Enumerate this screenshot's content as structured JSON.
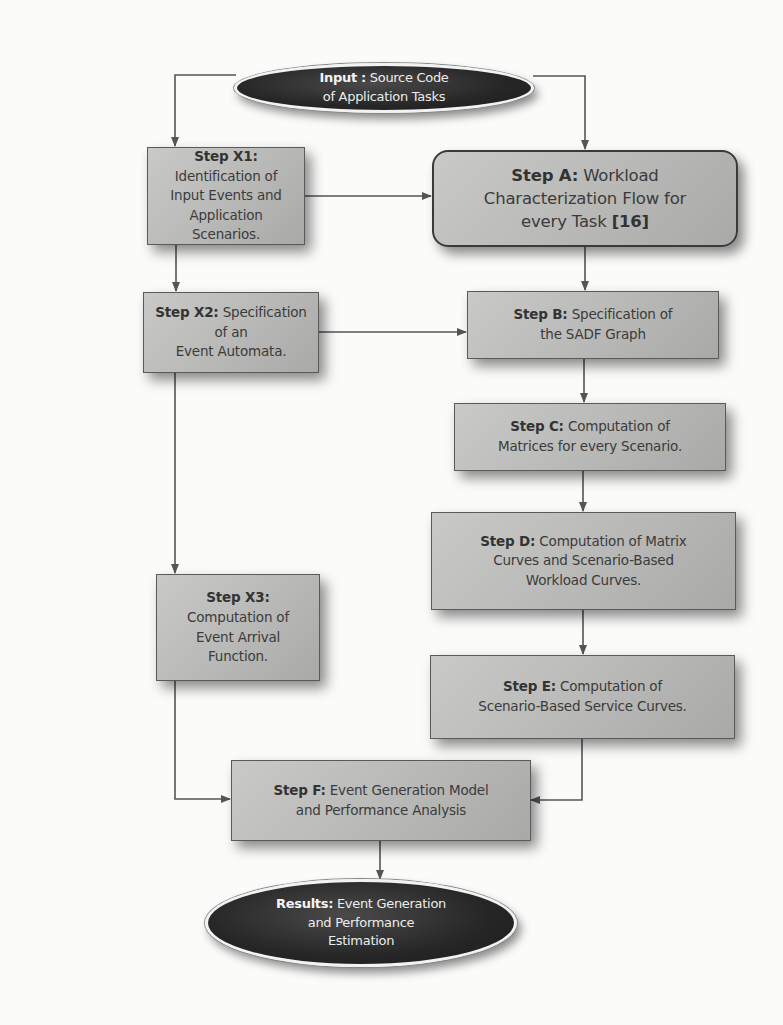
{
  "diagram": {
    "type": "flowchart",
    "colors": {
      "box_fill": "#b8b8b6",
      "box_border": "#5a5a5a",
      "ellipse_fill": "#262626",
      "ellipse_text": "#ececec",
      "arrow": "#555555",
      "background": "#fbfbfa"
    },
    "nodes": {
      "input": {
        "bold": "Input :",
        "line1": " Source Code",
        "line2": "of Application Tasks"
      },
      "x1": {
        "bold": "Step X1:",
        "line1": " Identification of",
        "line2": "Input Events and",
        "line3": "Application Scenarios."
      },
      "a": {
        "bold": "Step A:",
        "line1": "  Workload",
        "line2": "Characterization Flow for",
        "line3": "every Task ",
        "ref": "[16]"
      },
      "x2": {
        "bold": "Step X2:",
        "line1": " Specification of an",
        "line2": "Event Automata."
      },
      "b": {
        "bold": "Step B:",
        "line1": " Specification of",
        "line2": "the SADF Graph"
      },
      "c": {
        "bold": "Step C:",
        "line1": " Computation of",
        "line2": "Matrices for every Scenario."
      },
      "d": {
        "bold": "Step D:",
        "line1": " Computation of Matrix",
        "line2": "Curves  and Scenario-Based",
        "line3": "Workload Curves."
      },
      "x3": {
        "bold": "Step X3:",
        "line2": "Computation of",
        "line3": "Event Arrival",
        "line4": "Function."
      },
      "e": {
        "bold": "Step E:",
        "line1": " Computation of",
        "line2": "Scenario-Based Service Curves."
      },
      "f": {
        "bold": "Step F:",
        "line1": " Event Generation Model",
        "line2": "and Performance Analysis"
      },
      "results": {
        "bold": "Results:",
        "line1": " Event Generation",
        "line2": "and Performance",
        "line3": "Estimation"
      }
    },
    "edges": [
      {
        "from": "input",
        "to": "x1"
      },
      {
        "from": "input",
        "to": "a"
      },
      {
        "from": "x1",
        "to": "a"
      },
      {
        "from": "x1",
        "to": "x2"
      },
      {
        "from": "a",
        "to": "b"
      },
      {
        "from": "x2",
        "to": "b"
      },
      {
        "from": "x2",
        "to": "x3"
      },
      {
        "from": "b",
        "to": "c"
      },
      {
        "from": "c",
        "to": "d"
      },
      {
        "from": "d",
        "to": "e"
      },
      {
        "from": "x3",
        "to": "f"
      },
      {
        "from": "e",
        "to": "f"
      },
      {
        "from": "f",
        "to": "results"
      }
    ]
  }
}
